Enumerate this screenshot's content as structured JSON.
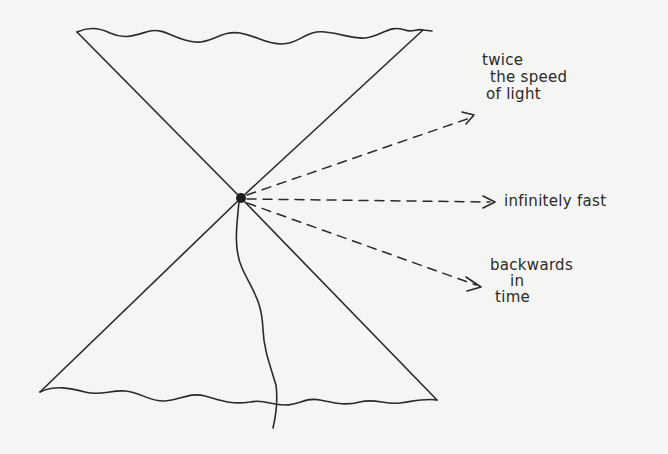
{
  "diagram": {
    "type": "light-cone",
    "stroke_color": "#2a2a2a",
    "background": "#f5f5f4",
    "event_point": {
      "x": 241,
      "y": 198
    },
    "cone": {
      "future": {
        "left": [
          77,
          32
        ],
        "right": [
          423,
          30
        ]
      },
      "past": {
        "left": [
          40,
          392
        ],
        "right": [
          437,
          400
        ]
      }
    },
    "arrows": [
      {
        "id": "twice",
        "label_lines": [
          "twice",
          "the speed",
          "of light"
        ],
        "to": [
          474,
          115
        ]
      },
      {
        "id": "infinite",
        "label_lines": [
          "infinitely fast"
        ],
        "to": [
          496,
          202
        ]
      },
      {
        "id": "backwards",
        "label_lines": [
          "backwards",
          "in",
          "time"
        ],
        "to": [
          481,
          287
        ]
      }
    ]
  },
  "labels": {
    "twice_line1": "twice",
    "twice_line2": "the speed",
    "twice_line3": "of light",
    "infinite": "infinitely fast",
    "backwards_line1": "backwards",
    "backwards_line2": "in",
    "backwards_line3": "time"
  }
}
